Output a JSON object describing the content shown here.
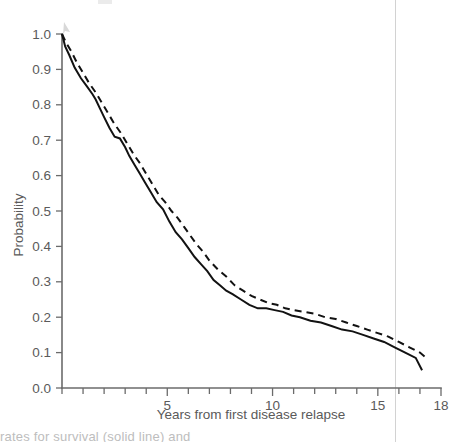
{
  "figure": {
    "caption_fragment": "rates for survival (solid line) and"
  },
  "chart_data": {
    "type": "line",
    "title": "",
    "subtitle": "",
    "xlabel": "Years from first disease relapse",
    "ylabel": "Probability",
    "xlim": [
      0,
      18
    ],
    "ylim": [
      0.0,
      1.0
    ],
    "grid": false,
    "legend_position": "none",
    "x_tick_labels": [
      "5",
      "10",
      "15",
      "18"
    ],
    "x_tick_values": [
      5,
      10,
      15,
      18
    ],
    "x_minor_tick_step": 1,
    "y_tick_labels": [
      "0.0",
      "0.1",
      "0.2",
      "0.3",
      "0.4",
      "0.5",
      "0.6",
      "0.7",
      "0.8",
      "0.9",
      "1.0"
    ],
    "y_tick_values": [
      0.0,
      0.1,
      0.2,
      0.3,
      0.4,
      0.5,
      0.6,
      0.7,
      0.8,
      0.9,
      1.0
    ],
    "annotations": [],
    "series": [
      {
        "name": "solid-curve",
        "style": "solid",
        "color": "#121212",
        "x": [
          0.0,
          0.15,
          0.35,
          0.6,
          0.9,
          1.15,
          1.45,
          1.6,
          1.8,
          2.0,
          2.25,
          2.5,
          2.75,
          3.0,
          3.2,
          3.45,
          3.7,
          3.95,
          4.2,
          4.5,
          4.8,
          5.1,
          5.4,
          5.7,
          6.0,
          6.3,
          6.6,
          6.9,
          7.2,
          7.5,
          7.8,
          8.1,
          8.5,
          8.9,
          9.3,
          9.7,
          10.1,
          10.5,
          10.9,
          11.3,
          11.8,
          12.3,
          12.8,
          13.3,
          13.8,
          14.3,
          14.8,
          15.3,
          15.8,
          16.3,
          16.8,
          17.1
        ],
        "y": [
          1.0,
          0.965,
          0.94,
          0.905,
          0.875,
          0.855,
          0.83,
          0.815,
          0.79,
          0.765,
          0.735,
          0.71,
          0.705,
          0.68,
          0.655,
          0.63,
          0.605,
          0.58,
          0.555,
          0.525,
          0.505,
          0.47,
          0.44,
          0.42,
          0.395,
          0.37,
          0.35,
          0.33,
          0.305,
          0.29,
          0.275,
          0.265,
          0.25,
          0.235,
          0.225,
          0.225,
          0.22,
          0.215,
          0.205,
          0.2,
          0.19,
          0.185,
          0.175,
          0.165,
          0.16,
          0.15,
          0.14,
          0.13,
          0.115,
          0.1,
          0.085,
          0.05
        ]
      },
      {
        "name": "dashed-curve",
        "style": "dashed",
        "color": "#121212",
        "x": [
          0.0,
          0.2,
          0.45,
          0.7,
          1.0,
          1.3,
          1.6,
          1.9,
          2.2,
          2.5,
          2.8,
          3.1,
          3.4,
          3.7,
          4.0,
          4.3,
          4.6,
          4.9,
          5.2,
          5.5,
          5.8,
          6.1,
          6.4,
          6.7,
          7.0,
          7.4,
          7.8,
          8.2,
          8.6,
          9.0,
          9.4,
          9.8,
          10.2,
          10.6,
          11.0,
          11.5,
          12.0,
          12.5,
          13.0,
          13.5,
          14.0,
          14.5,
          15.0,
          15.5,
          16.0,
          16.5,
          17.0,
          17.3
        ],
        "y": [
          1.0,
          0.975,
          0.95,
          0.92,
          0.89,
          0.86,
          0.835,
          0.805,
          0.775,
          0.745,
          0.72,
          0.69,
          0.66,
          0.635,
          0.605,
          0.575,
          0.545,
          0.525,
          0.5,
          0.48,
          0.455,
          0.43,
          0.405,
          0.385,
          0.36,
          0.335,
          0.315,
          0.29,
          0.275,
          0.26,
          0.25,
          0.24,
          0.235,
          0.225,
          0.22,
          0.215,
          0.21,
          0.2,
          0.195,
          0.185,
          0.175,
          0.165,
          0.155,
          0.145,
          0.13,
          0.115,
          0.1,
          0.085
        ]
      }
    ]
  }
}
